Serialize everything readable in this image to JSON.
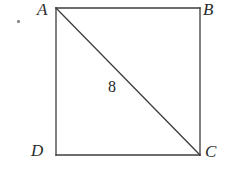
{
  "figure": {
    "type": "geometry-diagram",
    "shape": "square-with-diagonal",
    "background_color": "#ffffff",
    "stroke_color": "#3c3c3c",
    "stroke_width": 1.3,
    "square": {
      "left": 56,
      "top": 8,
      "right": 200,
      "bottom": 155
    },
    "diagonal": {
      "from": "A",
      "to": "C",
      "x1": 56,
      "y1": 8,
      "x2": 200,
      "y2": 155
    },
    "vertices": [
      {
        "id": "A",
        "label": "A",
        "corner": "top-left",
        "x": 56,
        "y": 8
      },
      {
        "id": "B",
        "label": "B",
        "corner": "top-right",
        "x": 200,
        "y": 8
      },
      {
        "id": "C",
        "label": "C",
        "corner": "bottom-right",
        "x": 200,
        "y": 155
      },
      {
        "id": "D",
        "label": "D",
        "corner": "bottom-left",
        "x": 56,
        "y": 155
      }
    ],
    "measurements": [
      {
        "id": "diagonal-length",
        "label": "8",
        "applies_to": "AC",
        "x": 114,
        "y": 88
      }
    ],
    "artifacts": [
      {
        "id": "stray-mark",
        "x": 18,
        "y": 21,
        "color": "#8a8a8a"
      }
    ]
  }
}
